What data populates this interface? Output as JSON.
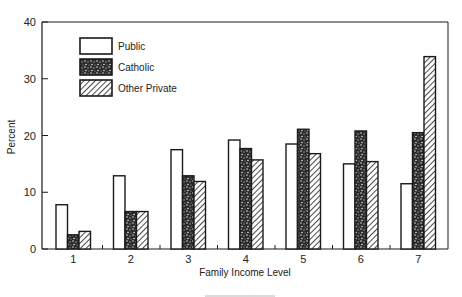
{
  "chart_data": {
    "type": "bar",
    "title": "",
    "xlabel": "Family Income Level",
    "ylabel": "Percent",
    "ylim": [
      0,
      40
    ],
    "yticks": [
      0,
      10,
      20,
      30,
      40
    ],
    "grid": false,
    "legend_position": "upper-left",
    "categories": [
      "1",
      "2",
      "3",
      "4",
      "5",
      "6",
      "7"
    ],
    "series": [
      {
        "name": "Public",
        "pattern": "white",
        "values": [
          7.8,
          12.9,
          17.5,
          19.2,
          18.5,
          15.0,
          11.5
        ]
      },
      {
        "name": "Catholic",
        "pattern": "stipple",
        "values": [
          2.5,
          6.6,
          12.9,
          17.7,
          21.1,
          20.8,
          20.5
        ]
      },
      {
        "name": "Other Private",
        "pattern": "hatch",
        "values": [
          3.1,
          6.6,
          11.9,
          15.7,
          16.8,
          15.4,
          33.9
        ]
      }
    ]
  },
  "colors": {
    "ink": "#1a1a1a",
    "background": "#ffffff"
  }
}
